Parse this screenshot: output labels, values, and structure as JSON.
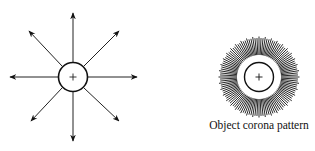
{
  "left_diagram": {
    "label": "Positive charge with outward field arrows",
    "center_symbol": "+",
    "arrow_count": 8
  },
  "right_diagram": {
    "label": "Corona discharge pattern",
    "center_symbol": "+",
    "caption": "Object corona pattern"
  },
  "colors": {
    "ink": "#111111",
    "background": "#ffffff"
  }
}
